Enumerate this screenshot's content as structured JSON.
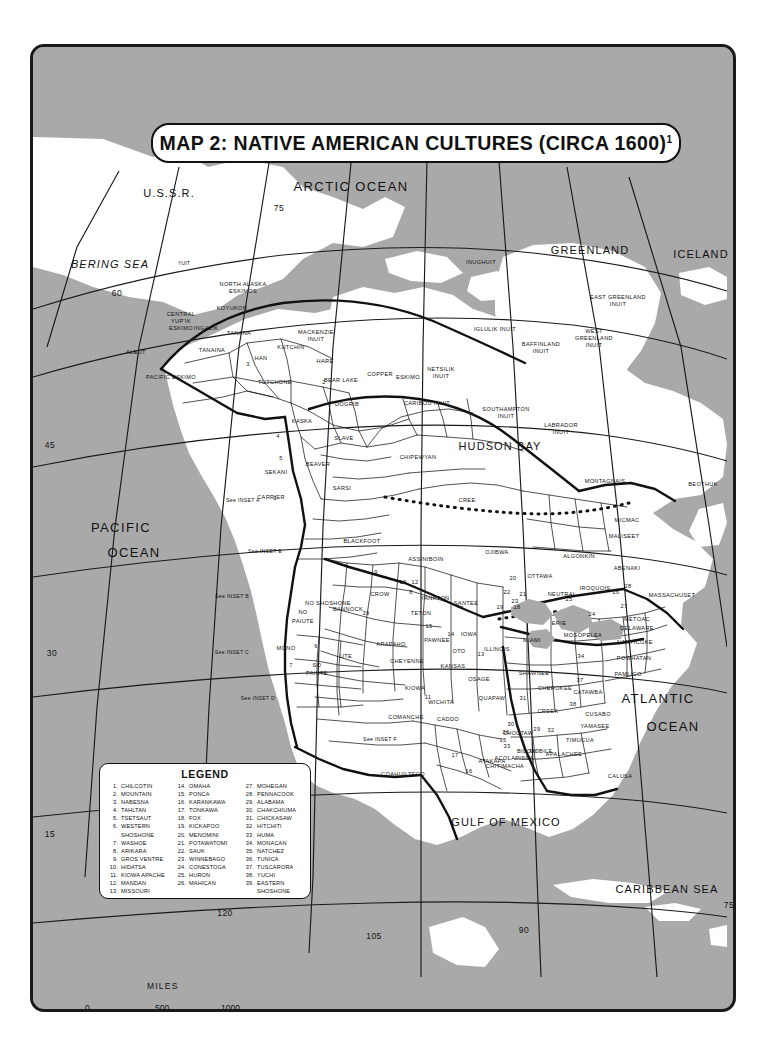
{
  "title": {
    "text": "MAP 2: NATIVE AMERICAN CULTURES (CIRCA 1600)",
    "footnote_marker": "1"
  },
  "footnote": {
    "marker": "1",
    "text": "See also MAP 2 INSETS."
  },
  "scale": {
    "unit_label": "MILES",
    "ticks": [
      "0",
      "500",
      "1000"
    ]
  },
  "legend": {
    "title": "LEGEND",
    "entries": [
      {
        "num": "1.",
        "name": "CHILCOTIN"
      },
      {
        "num": "2.",
        "name": "MOUNTAIN"
      },
      {
        "num": "3.",
        "name": "NABESNA"
      },
      {
        "num": "4.",
        "name": "TAHLTAN"
      },
      {
        "num": "5.",
        "name": "TSETSAUT"
      },
      {
        "num": "6.",
        "name": "WESTERN",
        "cont": "SHOSHONE"
      },
      {
        "num": "7.",
        "name": "WASHOE"
      },
      {
        "num": "8.",
        "name": "ARIKARA"
      },
      {
        "num": "9.",
        "name": "GROS VENTRE"
      },
      {
        "num": "10.",
        "name": "HIDATSA"
      },
      {
        "num": "11.",
        "name": "KIOWA APACHE"
      },
      {
        "num": "12.",
        "name": "MANDAN"
      },
      {
        "num": "13.",
        "name": "MISSOURI"
      },
      {
        "num": "14.",
        "name": "OMAHA"
      },
      {
        "num": "15.",
        "name": "PONCA"
      },
      {
        "num": "16.",
        "name": "KARANKAWA"
      },
      {
        "num": "17.",
        "name": "TONKAWA"
      },
      {
        "num": "18.",
        "name": "FOX"
      },
      {
        "num": "19.",
        "name": "KICKAPOO"
      },
      {
        "num": "20.",
        "name": "MENOMINI"
      },
      {
        "num": "21.",
        "name": "POTAWATOMI"
      },
      {
        "num": "22.",
        "name": "SAUK"
      },
      {
        "num": "23.",
        "name": "WINNEBAGO"
      },
      {
        "num": "24.",
        "name": "CONESTOGA"
      },
      {
        "num": "25.",
        "name": "HURON"
      },
      {
        "num": "26.",
        "name": "MAHICAN"
      },
      {
        "num": "27.",
        "name": "MOHEGAN"
      },
      {
        "num": "28.",
        "name": "PENNACOOK"
      },
      {
        "num": "29.",
        "name": "ALABAMA"
      },
      {
        "num": "30.",
        "name": "CHAKCHIUMA"
      },
      {
        "num": "31.",
        "name": "CHICKASAW"
      },
      {
        "num": "32.",
        "name": "HITCHITI"
      },
      {
        "num": "33.",
        "name": "HUMA"
      },
      {
        "num": "34.",
        "name": "MONACAN"
      },
      {
        "num": "35.",
        "name": "NATCHEZ"
      },
      {
        "num": "36.",
        "name": "TUNICA"
      },
      {
        "num": "37.",
        "name": "TUSCARORA"
      },
      {
        "num": "38.",
        "name": "YUCHI"
      },
      {
        "num": "39.",
        "name": "EASTERN",
        "cont": "SHOSHONE"
      }
    ]
  },
  "oceans": [
    {
      "name": "ARCTIC OCEAN",
      "x": 348,
      "y": 176,
      "cls": "ocean"
    },
    {
      "name": "BERING SEA",
      "x": 107,
      "y": 255,
      "cls": "ocean-sm italic"
    },
    {
      "name": "GREENLAND",
      "x": 587,
      "y": 241,
      "cls": "ocean-sm"
    },
    {
      "name": "ICELAND",
      "x": 698,
      "y": 245,
      "cls": "ocean-sm"
    },
    {
      "name": "U.S.S.R.",
      "x": 166,
      "y": 184,
      "cls": "ocean-sm"
    },
    {
      "name": "PACIFIC",
      "x": 118,
      "y": 517,
      "cls": "ocean"
    },
    {
      "name": "OCEAN",
      "x": 131,
      "y": 542,
      "cls": "ocean"
    },
    {
      "name": "HUDSON BAY",
      "x": 497,
      "y": 437,
      "cls": "ocean-sm"
    },
    {
      "name": "ATLANTIC",
      "x": 655,
      "y": 688,
      "cls": "ocean"
    },
    {
      "name": "OCEAN",
      "x": 670,
      "y": 716,
      "cls": "ocean"
    },
    {
      "name": "GULF OF MEXICO",
      "x": 503,
      "y": 813,
      "cls": "ocean-sm"
    },
    {
      "name": "CARIBBEAN SEA",
      "x": 664,
      "y": 880,
      "cls": "ocean-sm"
    }
  ],
  "graticule": [
    {
      "v": "75",
      "x": 276,
      "y": 200
    },
    {
      "v": "60",
      "x": 114,
      "y": 285
    },
    {
      "v": "45",
      "x": 47,
      "y": 437
    },
    {
      "v": "30",
      "x": 49,
      "y": 645
    },
    {
      "v": "15",
      "x": 47,
      "y": 826
    },
    {
      "v": "120",
      "x": 222,
      "y": 905
    },
    {
      "v": "105",
      "x": 371,
      "y": 928
    },
    {
      "v": "90",
      "x": 521,
      "y": 922
    },
    {
      "v": "75",
      "x": 726,
      "y": 897
    }
  ],
  "insets": [
    {
      "label": "See INSET A",
      "x": 240,
      "y": 494
    },
    {
      "label": "See INSET E",
      "x": 262,
      "y": 545
    },
    {
      "label": "See INSET B",
      "x": 229,
      "y": 590
    },
    {
      "label": "See INSET C",
      "x": 229,
      "y": 646
    },
    {
      "label": "See INSET D",
      "x": 255,
      "y": 692
    },
    {
      "label": "See INSET F",
      "x": 377,
      "y": 733
    }
  ],
  "regions": [
    {
      "n": "YUIT",
      "x": 181,
      "y": 257,
      "cls": "tiny"
    },
    {
      "n": "NORTH ALASKA",
      "x": 240,
      "y": 278,
      "cls": "region"
    },
    {
      "n": "ESKIMOS",
      "x": 240,
      "y": 285,
      "cls": "region"
    },
    {
      "n": "INUGHUIT",
      "x": 478,
      "y": 256,
      "cls": "region"
    },
    {
      "n": "IGLULIK INUIT",
      "x": 492,
      "y": 323,
      "cls": "region"
    },
    {
      "n": "WEST",
      "x": 591,
      "y": 325,
      "cls": "region"
    },
    {
      "n": "GREENLAND",
      "x": 591,
      "y": 332,
      "cls": "region"
    },
    {
      "n": "INUIT",
      "x": 591,
      "y": 339,
      "cls": "region"
    },
    {
      "n": "EAST GREENLAND",
      "x": 615,
      "y": 291,
      "cls": "region"
    },
    {
      "n": "INUIT",
      "x": 615,
      "y": 298,
      "cls": "region"
    },
    {
      "n": "BAFFINLAND",
      "x": 538,
      "y": 338,
      "cls": "region"
    },
    {
      "n": "INUIT",
      "x": 538,
      "y": 345,
      "cls": "region"
    },
    {
      "n": "SOUTHAMPTON",
      "x": 503,
      "y": 403,
      "cls": "region"
    },
    {
      "n": "INUIT",
      "x": 503,
      "y": 410,
      "cls": "region"
    },
    {
      "n": "LABRADOR",
      "x": 558,
      "y": 419,
      "cls": "region"
    },
    {
      "n": "INUIT",
      "x": 558,
      "y": 426,
      "cls": "region"
    },
    {
      "n": "KOYUKON",
      "x": 229,
      "y": 302,
      "cls": "region"
    },
    {
      "n": "CENTRAL",
      "x": 178,
      "y": 308,
      "cls": "region"
    },
    {
      "n": "YUP'IK",
      "x": 178,
      "y": 315,
      "cls": "region"
    },
    {
      "n": "ESKIMO",
      "x": 178,
      "y": 322,
      "cls": "region"
    },
    {
      "n": "INGALIK",
      "x": 203,
      "y": 322,
      "cls": "region"
    },
    {
      "n": "TANANA",
      "x": 236,
      "y": 327,
      "cls": "region"
    },
    {
      "n": "TANAINA",
      "x": 209,
      "y": 344,
      "cls": "region"
    },
    {
      "n": "ALEUT",
      "x": 133,
      "y": 346,
      "cls": "region"
    },
    {
      "n": "PACIFIC ESKIMO",
      "x": 168,
      "y": 371,
      "cls": "region"
    },
    {
      "n": "KUTCHIN",
      "x": 288,
      "y": 341,
      "cls": "region"
    },
    {
      "n": "HAN",
      "x": 258,
      "y": 352,
      "cls": "region"
    },
    {
      "n": "HARE",
      "x": 322,
      "y": 355,
      "cls": "region"
    },
    {
      "n": "MACKENZIE",
      "x": 313,
      "y": 326,
      "cls": "region"
    },
    {
      "n": "INUIT",
      "x": 313,
      "y": 333,
      "cls": "region"
    },
    {
      "n": "TUTCHONE",
      "x": 272,
      "y": 376,
      "cls": "region"
    },
    {
      "n": "BEAR LAKE",
      "x": 338,
      "y": 374,
      "cls": "region"
    },
    {
      "n": "COPPER",
      "x": 377,
      "y": 368,
      "cls": "region"
    },
    {
      "n": "ESKIMO",
      "x": 405,
      "y": 371,
      "cls": "region"
    },
    {
      "n": "NETSILIK",
      "x": 438,
      "y": 363,
      "cls": "region"
    },
    {
      "n": "INUIT",
      "x": 438,
      "y": 370,
      "cls": "region"
    },
    {
      "n": "CARIBOU INUIT",
      "x": 424,
      "y": 397,
      "cls": "region"
    },
    {
      "n": "DOGRIB",
      "x": 344,
      "y": 398,
      "cls": "region"
    },
    {
      "n": "KASKA",
      "x": 299,
      "y": 415,
      "cls": "region"
    },
    {
      "n": "SLAVE",
      "x": 341,
      "y": 432,
      "cls": "region"
    },
    {
      "n": "CHIPEWYAN",
      "x": 415,
      "y": 451,
      "cls": "region"
    },
    {
      "n": "BEAVER",
      "x": 315,
      "y": 458,
      "cls": "region"
    },
    {
      "n": "SEKANI",
      "x": 273,
      "y": 466,
      "cls": "region"
    },
    {
      "n": "SARSI",
      "x": 339,
      "y": 482,
      "cls": "region"
    },
    {
      "n": "CARRIER",
      "x": 268,
      "y": 491,
      "cls": "region"
    },
    {
      "n": "CREE",
      "x": 464,
      "y": 494,
      "cls": "region"
    },
    {
      "n": "MONTAGNAIS",
      "x": 602,
      "y": 475,
      "cls": "region"
    },
    {
      "n": "BEOTHUK",
      "x": 700,
      "y": 478,
      "cls": "region"
    },
    {
      "n": "BLACKFOOT",
      "x": 359,
      "y": 535,
      "cls": "region"
    },
    {
      "n": "ASSINIBOIN",
      "x": 423,
      "y": 553,
      "cls": "region"
    },
    {
      "n": "OJIBWA",
      "x": 494,
      "y": 546,
      "cls": "region"
    },
    {
      "n": "ALGONKIN",
      "x": 576,
      "y": 550,
      "cls": "region"
    },
    {
      "n": "MICMAC",
      "x": 624,
      "y": 514,
      "cls": "region"
    },
    {
      "n": "MALISEET",
      "x": 621,
      "y": 530,
      "cls": "region"
    },
    {
      "n": "ABENAKI",
      "x": 624,
      "y": 562,
      "cls": "region"
    },
    {
      "n": "MASSACHUSET",
      "x": 669,
      "y": 589,
      "cls": "region"
    },
    {
      "n": "OTTAWA",
      "x": 537,
      "y": 570,
      "cls": "region"
    },
    {
      "n": "IROQUOIS",
      "x": 592,
      "y": 582,
      "cls": "region"
    },
    {
      "n": "NEUTRAL",
      "x": 559,
      "y": 588,
      "cls": "region"
    },
    {
      "n": "CROW",
      "x": 377,
      "y": 588,
      "cls": "region"
    },
    {
      "n": "YANKTON",
      "x": 432,
      "y": 592,
      "cls": "region"
    },
    {
      "n": "SANTEE",
      "x": 463,
      "y": 597,
      "cls": "region"
    },
    {
      "n": "TETON",
      "x": 418,
      "y": 607,
      "cls": "region"
    },
    {
      "n": "ERIE",
      "x": 556,
      "y": 617,
      "cls": "region"
    },
    {
      "n": "MOSOPELEA",
      "x": 580,
      "y": 629,
      "cls": "region"
    },
    {
      "n": "METOAC",
      "x": 634,
      "y": 613,
      "cls": "region"
    },
    {
      "n": "DELAWARE",
      "x": 634,
      "y": 622,
      "cls": "region"
    },
    {
      "n": "NANTICOKE",
      "x": 632,
      "y": 636,
      "cls": "region"
    },
    {
      "n": "POWHATAN",
      "x": 631,
      "y": 652,
      "cls": "region"
    },
    {
      "n": "PAMLICO",
      "x": 625,
      "y": 668,
      "cls": "region"
    },
    {
      "n": "NO",
      "x": 300,
      "y": 606,
      "cls": "region"
    },
    {
      "n": "PAIUTE",
      "x": 300,
      "y": 615,
      "cls": "region"
    },
    {
      "n": "NO SHOSHONE",
      "x": 325,
      "y": 597,
      "cls": "region"
    },
    {
      "n": "BANNOCK",
      "x": 345,
      "y": 603,
      "cls": "region"
    },
    {
      "n": "MONO",
      "x": 283,
      "y": 642,
      "cls": "region"
    },
    {
      "n": "UTE",
      "x": 343,
      "y": 650,
      "cls": "region"
    },
    {
      "n": "SO",
      "x": 314,
      "y": 659,
      "cls": "region"
    },
    {
      "n": "PAIUTE",
      "x": 314,
      "y": 667,
      "cls": "region"
    },
    {
      "n": "ARAPAHO",
      "x": 388,
      "y": 638,
      "cls": "region"
    },
    {
      "n": "CHEYENNE",
      "x": 404,
      "y": 655,
      "cls": "region"
    },
    {
      "n": "PAWNEE",
      "x": 434,
      "y": 634,
      "cls": "region"
    },
    {
      "n": "IOWA",
      "x": 466,
      "y": 628,
      "cls": "region"
    },
    {
      "n": "OTO",
      "x": 456,
      "y": 645,
      "cls": "region"
    },
    {
      "n": "KANSAS",
      "x": 450,
      "y": 660,
      "cls": "region"
    },
    {
      "n": "ILLINOIS",
      "x": 494,
      "y": 643,
      "cls": "region"
    },
    {
      "n": "MIAMI",
      "x": 529,
      "y": 634,
      "cls": "region"
    },
    {
      "n": "SHAWNEE",
      "x": 531,
      "y": 667,
      "cls": "region"
    },
    {
      "n": "OSAGE",
      "x": 476,
      "y": 673,
      "cls": "region"
    },
    {
      "n": "CHEROKEE",
      "x": 552,
      "y": 682,
      "cls": "region"
    },
    {
      "n": "CATAWBA",
      "x": 585,
      "y": 686,
      "cls": "region"
    },
    {
      "n": "KIOWA",
      "x": 412,
      "y": 682,
      "cls": "region"
    },
    {
      "n": "WICHITA",
      "x": 438,
      "y": 696,
      "cls": "region"
    },
    {
      "n": "QUAPAW",
      "x": 489,
      "y": 692,
      "cls": "region"
    },
    {
      "n": "CADDO",
      "x": 445,
      "y": 713,
      "cls": "region"
    },
    {
      "n": "COMANCHE",
      "x": 403,
      "y": 711,
      "cls": "region"
    },
    {
      "n": "CREEK",
      "x": 545,
      "y": 705,
      "cls": "region"
    },
    {
      "n": "CUSABO",
      "x": 595,
      "y": 708,
      "cls": "region"
    },
    {
      "n": "YAMASEE",
      "x": 592,
      "y": 720,
      "cls": "region"
    },
    {
      "n": "CHOCTAW",
      "x": 515,
      "y": 727,
      "cls": "region"
    },
    {
      "n": "MOBILE",
      "x": 538,
      "y": 745,
      "cls": "region"
    },
    {
      "n": "BILOXI",
      "x": 524,
      "y": 745,
      "cls": "region"
    },
    {
      "n": "APALACHEE",
      "x": 561,
      "y": 748,
      "cls": "region"
    },
    {
      "n": "TIMUCUA",
      "x": 577,
      "y": 734,
      "cls": "region"
    },
    {
      "n": "CALUSA",
      "x": 617,
      "y": 770,
      "cls": "region"
    },
    {
      "n": "ACOLAPISSA",
      "x": 511,
      "y": 752,
      "cls": "region"
    },
    {
      "n": "ATAKAPA",
      "x": 489,
      "y": 755,
      "cls": "region"
    },
    {
      "n": "CHITIMACHA",
      "x": 502,
      "y": 760,
      "cls": "region"
    },
    {
      "n": "COAHUILTECO",
      "x": 400,
      "y": 768,
      "cls": "region"
    }
  ],
  "numbered_on_map": [
    {
      "v": "1",
      "x": 272,
      "y": 492
    },
    {
      "v": "2",
      "x": 321,
      "y": 376
    },
    {
      "v": "3",
      "x": 245,
      "y": 358
    },
    {
      "v": "4",
      "x": 275,
      "y": 430
    },
    {
      "v": "5",
      "x": 278,
      "y": 452
    },
    {
      "v": "6",
      "x": 313,
      "y": 640
    },
    {
      "v": "7",
      "x": 288,
      "y": 659
    },
    {
      "v": "8",
      "x": 408,
      "y": 586
    },
    {
      "v": "9",
      "x": 373,
      "y": 566
    },
    {
      "v": "10",
      "x": 400,
      "y": 576
    },
    {
      "v": "11",
      "x": 425,
      "y": 691
    },
    {
      "v": "12",
      "x": 412,
      "y": 576
    },
    {
      "v": "13",
      "x": 478,
      "y": 648
    },
    {
      "v": "14",
      "x": 448,
      "y": 628
    },
    {
      "v": "15",
      "x": 426,
      "y": 620
    },
    {
      "v": "16",
      "x": 466,
      "y": 765
    },
    {
      "v": "17",
      "x": 452,
      "y": 749
    },
    {
      "v": "18",
      "x": 514,
      "y": 601
    },
    {
      "v": "19",
      "x": 497,
      "y": 601
    },
    {
      "v": "20",
      "x": 510,
      "y": 572
    },
    {
      "v": "21",
      "x": 520,
      "y": 588
    },
    {
      "v": "22",
      "x": 504,
      "y": 586
    },
    {
      "v": "23",
      "x": 512,
      "y": 595
    },
    {
      "v": "24",
      "x": 589,
      "y": 608
    },
    {
      "v": "25",
      "x": 566,
      "y": 593
    },
    {
      "v": "26",
      "x": 613,
      "y": 586
    },
    {
      "v": "27",
      "x": 621,
      "y": 600
    },
    {
      "v": "28",
      "x": 625,
      "y": 580
    },
    {
      "v": "29",
      "x": 534,
      "y": 723
    },
    {
      "v": "30",
      "x": 508,
      "y": 718
    },
    {
      "v": "31",
      "x": 520,
      "y": 692
    },
    {
      "v": "32",
      "x": 548,
      "y": 724
    },
    {
      "v": "33",
      "x": 504,
      "y": 740
    },
    {
      "v": "34",
      "x": 578,
      "y": 650
    },
    {
      "v": "35",
      "x": 500,
      "y": 734
    },
    {
      "v": "36",
      "x": 503,
      "y": 726
    },
    {
      "v": "37",
      "x": 577,
      "y": 674
    },
    {
      "v": "38",
      "x": 570,
      "y": 698
    },
    {
      "v": "39",
      "x": 363,
      "y": 607
    }
  ],
  "colors": {
    "sea": "#a9a9a9",
    "land": "#ffffff",
    "outline": "#111111",
    "paper": "#ffffff"
  }
}
